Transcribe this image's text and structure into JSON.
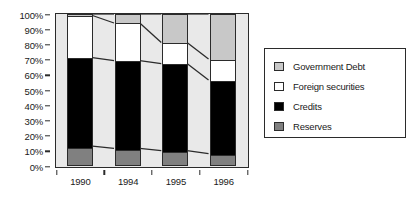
{
  "chart_data": {
    "type": "bar",
    "subtype": "100% stacked column",
    "title": "",
    "xlabel": "",
    "ylabel": "",
    "categories": [
      "1990",
      "1994",
      "1995",
      "1996"
    ],
    "ylim": [
      0,
      100
    ],
    "ytick_labels": [
      "0%",
      "10%",
      "20%",
      "30%",
      "40%",
      "50%",
      "60%",
      "70%",
      "80%",
      "90%",
      "100%"
    ],
    "ytick_values": [
      0,
      10,
      20,
      30,
      40,
      50,
      60,
      70,
      80,
      90,
      100
    ],
    "grid": false,
    "legend_position": "right",
    "stack_order_bottom_to_top": [
      "Reserves",
      "Credits",
      "Foreign securities",
      "Government Debt"
    ],
    "series": [
      {
        "name": "Reserves",
        "color": "#808080",
        "values": [
          12,
          10.5,
          9,
          7
        ]
      },
      {
        "name": "Credits",
        "color": "#000000",
        "values": [
          59,
          58.5,
          58,
          49
        ]
      },
      {
        "name": "Foreign securities",
        "color": "#ffffff",
        "values": [
          28,
          25,
          14,
          14
        ]
      },
      {
        "name": "Government Debt",
        "color": "#c8c8c8",
        "values": [
          1,
          6,
          19,
          30
        ]
      }
    ],
    "cumulative_boundaries": {
      "reserves_top": [
        12,
        10.5,
        9,
        7
      ],
      "credits_top": [
        71,
        69,
        67,
        56
      ],
      "foreign_securities_top": [
        99,
        94,
        81,
        70
      ],
      "government_debt_top": [
        100,
        100,
        100,
        100
      ]
    },
    "connector_lines": true
  },
  "legend": {
    "items": [
      {
        "label": "Government Debt",
        "color": "#c8c8c8",
        "icon": "legend-swatch-icon"
      },
      {
        "label": "Foreign securities",
        "color": "#ffffff",
        "icon": "legend-swatch-icon"
      },
      {
        "label": "Credits",
        "color": "#000000",
        "icon": "legend-swatch-icon"
      },
      {
        "label": "Reserves",
        "color": "#808080",
        "icon": "legend-swatch-icon"
      }
    ]
  },
  "style": {
    "plot_background": "#e9e9e9",
    "axis_color": "#2b2b2b",
    "text_color": "#1a1a1a",
    "page_background": "#ffffff"
  }
}
